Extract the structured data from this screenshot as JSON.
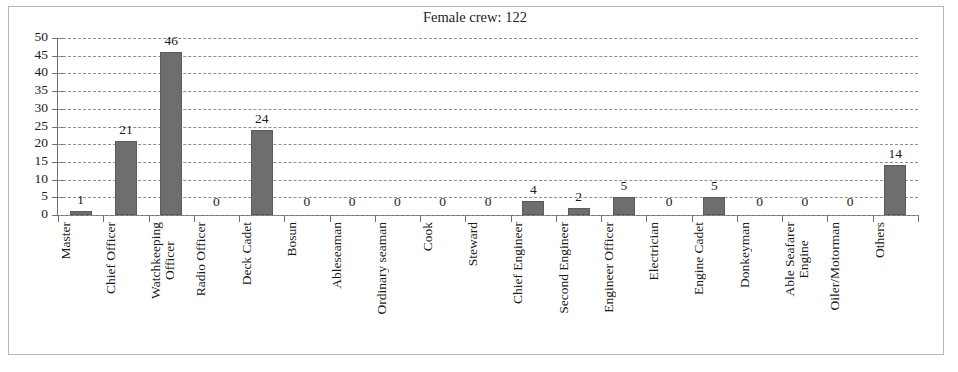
{
  "chart_data": {
    "type": "bar",
    "title": "Female crew: 122",
    "xlabel": "",
    "ylabel": "",
    "ylim": [
      0,
      50
    ],
    "ytick_step": 5,
    "yticks": [
      0,
      5,
      10,
      15,
      20,
      25,
      30,
      35,
      40,
      45,
      50
    ],
    "grid": true,
    "grid_style": "dashed-horizontal",
    "legend": false,
    "bar_color": "#6e6e6e",
    "data_labels": true,
    "categories": [
      "Master",
      "Chief Officer",
      "Watchkeeping Officer",
      "Radio Officer",
      "Deck Cadet",
      "Bosun",
      "Ableseaman",
      "Ordinary seaman",
      "Cook",
      "Steward",
      "Chief Engineer",
      "Second Engineer",
      "Engineer Officer",
      "Electrician",
      "Engine Cadet",
      "Donkeyman",
      "Able Seafarer Engine",
      "Oiler/Motorman",
      "Others"
    ],
    "category_label_lines": [
      "Master",
      "Chief Officer",
      "Watchkeeping\nOfficer",
      "Radio Officer",
      "Deck Cadet",
      "Bosun",
      "Ableseaman",
      "Ordinary seaman",
      "Cook",
      "Steward",
      "Chief Engineer",
      "Second Engineer",
      "Engineer Officer",
      "Electrician",
      "Engine Cadet",
      "Donkeyman",
      "Able Seafarer\nEngine",
      "Oiler/Motorman",
      "Others"
    ],
    "values": [
      1,
      21,
      46,
      0,
      24,
      0,
      0,
      0,
      0,
      0,
      4,
      2,
      5,
      0,
      5,
      0,
      0,
      0,
      14
    ],
    "value_labels": [
      "1",
      "21",
      "46",
      "0",
      "24",
      "0",
      "0",
      "0",
      "0",
      "0",
      "4",
      "2",
      "5",
      "0",
      "5",
      "0",
      "0",
      "0",
      "14"
    ]
  },
  "colors": {
    "bar": "#6e6e6e",
    "bar_border": "#5b5b5b",
    "axis": "#6f6f6f",
    "grid": "#8e8e8e",
    "frame": "#b9b9b9",
    "text": "#1b1b1b",
    "background": "#ffffff"
  }
}
